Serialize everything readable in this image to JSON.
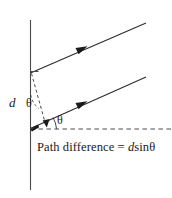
{
  "figure": {
    "name": "path-difference-diagram",
    "caption": {
      "prefix": "Path difference = ",
      "variable_d": "d",
      "function": "sin",
      "variable_theta": "θ",
      "full_text": "Path difference = dsinθ"
    },
    "labels": {
      "slit_separation": "d",
      "angle_at_slit": "θ",
      "angle_at_axis": "θ"
    },
    "colors": {
      "background": "#ffffff",
      "stroke": "#2b2b2b",
      "dashed_stroke": "#4a4a4a",
      "text": "#1a1a1a"
    },
    "elements": {
      "barrier_line": "vertical-barrier",
      "upper_ray": "upper-light-ray",
      "lower_ray": "lower-light-ray",
      "axis_line": "horizontal-reference-axis",
      "path_difference_segment": "path-difference-dashed-segment",
      "angle_arc_slit": "angle-arc-at-slit",
      "angle_arc_axis": "angle-arc-at-axis",
      "upper_arrowhead": "upper-ray-arrowhead",
      "lower_arrowhead": "lower-ray-arrowhead",
      "path_arrowhead": "path-difference-arrowhead"
    }
  }
}
